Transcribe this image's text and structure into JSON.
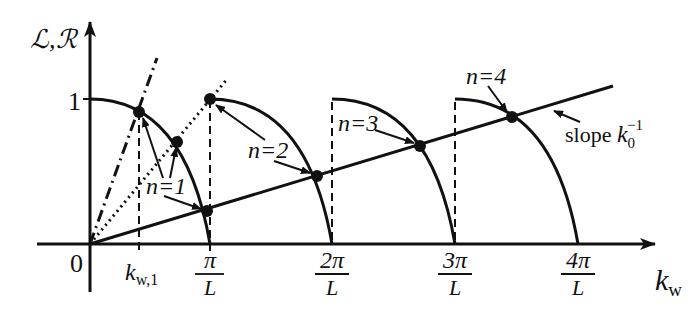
{
  "axes": {
    "y_label": "ℒ,ℛ",
    "x_label_main": "k",
    "x_label_sub": "w",
    "origin_label": "0",
    "y_tick_label": "1"
  },
  "x_ticks": [
    {
      "num": "k",
      "sub": "w,1",
      "kind": "kw1"
    },
    {
      "num": "π",
      "den": "L"
    },
    {
      "num": "2π",
      "den": "L"
    },
    {
      "num": "3π",
      "den": "L"
    },
    {
      "num": "4π",
      "den": "L"
    }
  ],
  "annotations": {
    "n1": "n=1",
    "n2": "n=2",
    "n3": "n=3",
    "n4": "n=4",
    "slope_text": "slope ",
    "slope_k": "k",
    "slope_sub": "0",
    "slope_sup": "−1"
  },
  "colors": {
    "ink": "#111111",
    "background": "#ffffff"
  }
}
